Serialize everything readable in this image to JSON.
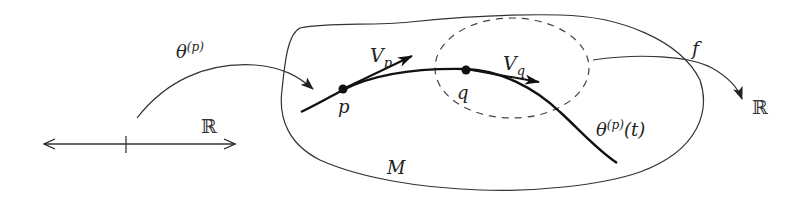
{
  "diagram": {
    "type": "manifold-tangent-vector-diagram",
    "labels": {
      "curve_map": "θ",
      "curve_map_sup": "(p)",
      "domain_line": "ℝ",
      "point_p": "p",
      "point_q": "q",
      "vector_p": "V",
      "vector_p_sub": "p",
      "vector_q": "V",
      "vector_q_sub": "q",
      "function": "f",
      "codomain": "ℝ",
      "curve_label": "θ",
      "curve_label_sup": "(p)",
      "curve_label_arg": "(t)",
      "manifold": "M"
    },
    "elements": [
      {
        "name": "real-line",
        "kind": "double-arrow",
        "label": "ℝ"
      },
      {
        "name": "curve-map-arrow",
        "kind": "arrow",
        "label": "θ^(p)",
        "from": "real-line",
        "to": "point-p"
      },
      {
        "name": "manifold-boundary",
        "kind": "closed-curve",
        "label": "M"
      },
      {
        "name": "integral-curve",
        "kind": "curve",
        "label": "θ^(p)(t)",
        "through": [
          "p",
          "q"
        ]
      },
      {
        "name": "neighborhood",
        "kind": "dashed-ellipse",
        "around": "q"
      },
      {
        "name": "tangent-vector-p",
        "kind": "arrow",
        "label": "V_p"
      },
      {
        "name": "tangent-vector-q",
        "kind": "arrow",
        "label": "V_q"
      },
      {
        "name": "function-arrow",
        "kind": "arrow",
        "label": "f",
        "from": "neighborhood",
        "to": "codomain"
      }
    ],
    "colors": {
      "stroke": "#222222",
      "background": "#ffffff"
    }
  }
}
